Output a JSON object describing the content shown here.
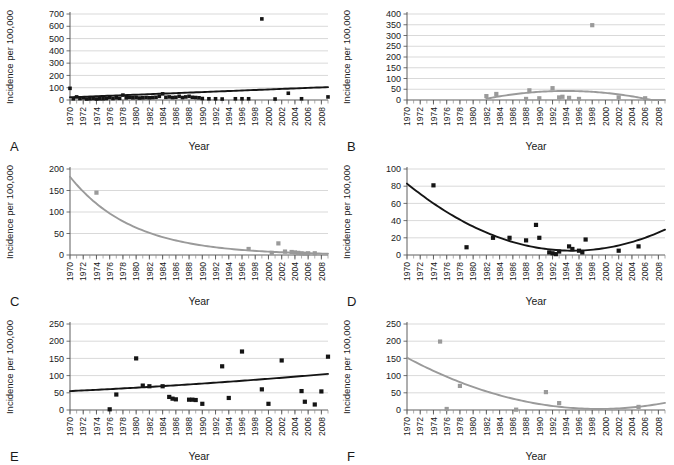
{
  "figure": {
    "panel_letters": [
      "A",
      "B",
      "C",
      "D",
      "E",
      "F"
    ],
    "axis_label_x": "Year",
    "axis_label_y": "Incidence per 100,000",
    "colors": {
      "dark_series": "#151515",
      "light_series": "#9a9a9a",
      "grid": "#cfcfcf",
      "axis": "#4d4d4d",
      "background": "#ffffff"
    }
  },
  "chart_data": [
    {
      "id": "A",
      "letter": "A",
      "type": "scatter",
      "title": "",
      "xlabel": "Year",
      "ylabel": "Incidence per 100,000",
      "xlim": [
        1970,
        2009
      ],
      "ylim": [
        0,
        700
      ],
      "yticks": [
        0,
        100,
        200,
        300,
        400,
        500,
        600,
        700
      ],
      "xticks": [
        1970,
        1972,
        1974,
        1976,
        1978,
        1980,
        1982,
        1984,
        1986,
        1988,
        1990,
        1992,
        1994,
        1996,
        1998,
        2000,
        2002,
        2004,
        2006,
        2008
      ],
      "grid": true,
      "legend": "none",
      "series_color": "#151515",
      "marker": "square",
      "x": [
        1970,
        1970.5,
        1971,
        1971.5,
        1972,
        1972.5,
        1973,
        1973.5,
        1974,
        1974.5,
        1975,
        1975.5,
        1976,
        1976.5,
        1977,
        1977.5,
        1978,
        1978.5,
        1979,
        1979.5,
        1980,
        1980.5,
        1981,
        1981.5,
        1982,
        1982.5,
        1983,
        1983.5,
        1984,
        1984.5,
        1985,
        1985.5,
        1986,
        1986.5,
        1987,
        1987.5,
        1988,
        1988.5,
        1989,
        1989.5,
        1990,
        1991,
        1992,
        1993,
        1995,
        1996,
        1997,
        1999,
        2001,
        2003,
        2005,
        2009
      ],
      "y": [
        95,
        10,
        25,
        12,
        18,
        8,
        10,
        12,
        8,
        10,
        10,
        12,
        20,
        12,
        18,
        14,
        40,
        18,
        22,
        18,
        20,
        16,
        18,
        20,
        18,
        20,
        22,
        30,
        50,
        22,
        25,
        20,
        22,
        30,
        20,
        25,
        30,
        22,
        20,
        18,
        12,
        10,
        10,
        8,
        10,
        10,
        10,
        660,
        8,
        55,
        10,
        25
      ],
      "trendline": {
        "type": "linear",
        "description": "slight upward linear trend",
        "y_start": 22,
        "y_end": 105,
        "color": "#151515"
      }
    },
    {
      "id": "B",
      "letter": "B",
      "type": "scatter",
      "title": "",
      "xlabel": "Year",
      "ylabel": "Incidence per 100,000",
      "xlim": [
        1970,
        2009
      ],
      "ylim": [
        0,
        400
      ],
      "yticks": [
        0,
        50,
        100,
        150,
        200,
        250,
        300,
        350,
        400
      ],
      "xticks": [
        1970,
        1972,
        1974,
        1976,
        1978,
        1980,
        1982,
        1984,
        1986,
        1988,
        1990,
        1992,
        1994,
        1996,
        1998,
        2000,
        2002,
        2004,
        2006,
        2008
      ],
      "grid": true,
      "legend": "none",
      "series_color": "#9a9a9a",
      "marker": "square",
      "x": [
        1982,
        1983.5,
        1988,
        1988.5,
        1990,
        1992,
        1993,
        1993.5,
        1994.5,
        1996,
        1998,
        2002,
        2006
      ],
      "y": [
        18,
        28,
        5,
        45,
        8,
        55,
        12,
        15,
        10,
        5,
        348,
        12,
        8
      ],
      "trendline": {
        "type": "quadratic",
        "description": "shallow inverted-U peaking near 1994",
        "color": "#9a9a9a",
        "x_range": [
          1982,
          2009
        ],
        "peak_x": 1994,
        "peak_y": 42,
        "y_start": 6,
        "y_end": 0
      }
    },
    {
      "id": "C",
      "letter": "C",
      "type": "scatter",
      "title": "",
      "xlabel": "Year",
      "ylabel": "Incidence per 100,000",
      "xlim": [
        1970,
        2009
      ],
      "ylim": [
        0,
        200
      ],
      "yticks": [
        0,
        50,
        100,
        150,
        200
      ],
      "xticks": [
        1970,
        1972,
        1974,
        1976,
        1978,
        1980,
        1982,
        1984,
        1986,
        1988,
        1990,
        1992,
        1994,
        1996,
        1998,
        2000,
        2002,
        2004,
        2006,
        2008
      ],
      "grid": true,
      "legend": "none",
      "series_color": "#9a9a9a",
      "marker": "square",
      "x": [
        1974,
        1997,
        2000.5,
        2001.5,
        2002.5,
        2003.5,
        2004,
        2004.5,
        2005,
        2005.5,
        2006,
        2007
      ],
      "y": [
        145,
        14,
        5,
        27,
        8,
        7,
        6,
        5,
        4,
        3,
        4,
        4
      ],
      "trendline": {
        "type": "exponential-decay",
        "description": "steep decay from ~182 in 1970 flattening near 3 by 2009",
        "color": "#9a9a9a",
        "y_start": 182,
        "y_end": 3
      }
    },
    {
      "id": "D",
      "letter": "D",
      "type": "scatter",
      "title": "",
      "xlabel": "Year",
      "ylabel": "Incidence per 100,000",
      "xlim": [
        1970,
        2009
      ],
      "ylim": [
        0,
        100
      ],
      "yticks": [
        0,
        20,
        40,
        60,
        80,
        100
      ],
      "xticks": [
        1970,
        1972,
        1974,
        1976,
        1978,
        1980,
        1982,
        1984,
        1986,
        1988,
        1990,
        1992,
        1994,
        1996,
        1998,
        2000,
        2002,
        2004,
        2006,
        2008
      ],
      "grid": true,
      "legend": "none",
      "series_color": "#151515",
      "marker": "square",
      "x": [
        1974,
        1979,
        1983,
        1985.5,
        1988,
        1989.5,
        1990,
        1991.5,
        1992,
        1992.5,
        1993,
        1994.5,
        1995,
        1996,
        1996.5,
        1997,
        2002,
        2005
      ],
      "y": [
        81,
        9,
        20,
        20,
        17,
        35,
        20,
        3,
        2,
        1,
        4,
        10,
        7,
        5,
        3,
        18,
        5,
        10
      ],
      "trendline": {
        "type": "quadratic",
        "description": "U-shaped: falls from ~83 in 1970 to minimum ~5 near 1995, rises to ~20 by 2009",
        "color": "#151515",
        "y_start": 83,
        "min_x": 1995,
        "min_y": 5,
        "y_end": 20
      }
    },
    {
      "id": "E",
      "letter": "E",
      "type": "scatter",
      "title": "",
      "xlabel": "Year",
      "ylabel": "Incidence per 100,000",
      "xlim": [
        1970,
        2009
      ],
      "ylim": [
        0,
        250
      ],
      "yticks": [
        0,
        50,
        100,
        150,
        200,
        250
      ],
      "xticks": [
        1970,
        1972,
        1974,
        1976,
        1978,
        1980,
        1982,
        1984,
        1986,
        1988,
        1990,
        1992,
        1994,
        1996,
        1998,
        2000,
        2002,
        2004,
        2006,
        2008
      ],
      "grid": true,
      "legend": "none",
      "series_color": "#151515",
      "marker": "square",
      "x": [
        1976,
        1977,
        1980,
        1981,
        1982,
        1984,
        1985,
        1985.5,
        1986,
        1988,
        1988.5,
        1989,
        1990,
        1993,
        1994,
        1996,
        1999,
        2000,
        2002,
        2005,
        2005.5,
        2007,
        2008,
        2009
      ],
      "y": [
        2,
        45,
        150,
        71,
        69,
        69,
        38,
        33,
        31,
        30,
        30,
        29,
        18,
        127,
        35,
        170,
        60,
        18,
        144,
        55,
        24,
        16,
        54,
        155
      ],
      "trendline": {
        "type": "quadratic",
        "description": "gently rising curve from ~55 in 1970 to ~105 by 2009",
        "color": "#151515",
        "y_start": 55,
        "y_end": 105
      }
    },
    {
      "id": "F",
      "letter": "F",
      "type": "scatter",
      "title": "",
      "xlabel": "Year",
      "ylabel": "Incidence per 100,000",
      "xlim": [
        1970,
        2009
      ],
      "ylim": [
        0,
        250
      ],
      "yticks": [
        0,
        50,
        100,
        150,
        200,
        250
      ],
      "xticks": [
        1970,
        1972,
        1974,
        1976,
        1978,
        1980,
        1982,
        1984,
        1986,
        1988,
        1990,
        1992,
        1994,
        1996,
        1998,
        2000,
        2002,
        2004,
        2006,
        2008
      ],
      "grid": true,
      "legend": "none",
      "series_color": "#9a9a9a",
      "marker": "square",
      "x": [
        1975,
        1976,
        1978,
        1986.5,
        1991,
        1993,
        2005
      ],
      "y": [
        199,
        3,
        70,
        1,
        52,
        20,
        9
      ],
      "trendline": {
        "type": "quadratic",
        "description": "falls from ~152 in 1970 to minimum ~3 near 1999, rising slightly to ~33 by 2009",
        "color": "#9a9a9a",
        "y_start": 152,
        "min_x": 1999,
        "min_y": 3,
        "y_end": 33
      }
    }
  ]
}
